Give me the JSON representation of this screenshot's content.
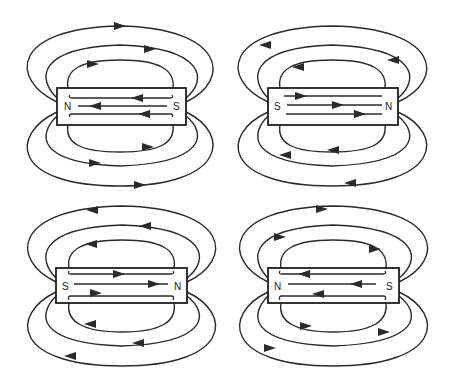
{
  "diagram": {
    "colors": {
      "line": "#2a2a2a",
      "background": "#ffffff"
    },
    "magnets": [
      {
        "id": "top-left",
        "left_pole": "N",
        "right_pole": "S",
        "internal_direction": "left",
        "external_top_direction": "right",
        "external_bottom_direction": "right"
      },
      {
        "id": "top-right",
        "left_pole": "S",
        "right_pole": "N",
        "internal_direction": "right",
        "external_top_direction": "left",
        "external_bottom_direction": "left"
      },
      {
        "id": "bottom-left",
        "left_pole": "S",
        "right_pole": "N",
        "internal_direction": "right",
        "external_top_direction": "left",
        "external_bottom_direction": "left"
      },
      {
        "id": "bottom-right",
        "left_pole": "N",
        "right_pole": "S",
        "internal_direction": "left",
        "external_top_direction": "right",
        "external_bottom_direction": "right"
      }
    ]
  }
}
